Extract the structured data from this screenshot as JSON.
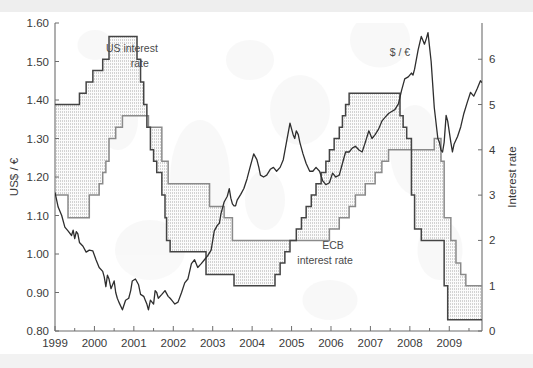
{
  "chart_data": {
    "type": "line",
    "title": "",
    "subtitle": "",
    "xlabel": "",
    "ylabel": "US$ / €",
    "y2label": "Interest rate",
    "xlim": [
      1999.0,
      2009.83
    ],
    "ylim": [
      0.8,
      1.6
    ],
    "y2lim": [
      0,
      6.8
    ],
    "grid": false,
    "legend_position": "inline-annotations",
    "xticks": [
      1999,
      2000,
      2001,
      2002,
      2003,
      2004,
      2005,
      2006,
      2007,
      2008,
      2009
    ],
    "xticklabels": [
      "1999",
      "2000",
      "2001",
      "2002",
      "2003",
      "2004",
      "2005",
      "2006",
      "2007",
      "2008",
      "2009"
    ],
    "xminor_interval": 0.5,
    "yticks": [
      0.8,
      0.9,
      1.0,
      1.1,
      1.2,
      1.3,
      1.4,
      1.5,
      1.6
    ],
    "yticklabels": [
      "0.80",
      "0.90",
      "1.00",
      "1.10",
      "1.20",
      "1.30",
      "1.40",
      "1.50",
      "1.60"
    ],
    "y2ticks": [
      0,
      1,
      2,
      3,
      4,
      5,
      6
    ],
    "y2ticklabels": [
      "0",
      "1",
      "2",
      "3",
      "4",
      "5",
      "6"
    ],
    "annotations": [
      {
        "text": "US interest",
        "x": 2000.95,
        "y": 1.525
      },
      {
        "text": "rate",
        "x": 2001.15,
        "y": 1.487
      },
      {
        "text": "ECB",
        "x": 2006.05,
        "y": 1.012
      },
      {
        "text": "interest rate",
        "x": 2005.85,
        "y": 0.975
      },
      {
        "text": "$ / €",
        "x": 2007.75,
        "y": 1.513
      }
    ],
    "series": [
      {
        "name": "US interest rate",
        "axis": "right",
        "style": "step",
        "color": "#444444",
        "fill": "dotted-light-gray",
        "points": [
          [
            1999.0,
            5.0
          ],
          [
            1999.58,
            5.0
          ],
          [
            1999.62,
            5.25
          ],
          [
            1999.79,
            5.5
          ],
          [
            1999.88,
            5.5
          ],
          [
            1999.96,
            5.75
          ],
          [
            2000.12,
            5.75
          ],
          [
            2000.21,
            6.0
          ],
          [
            2000.29,
            6.0
          ],
          [
            2000.37,
            6.5
          ],
          [
            2000.46,
            6.5
          ],
          [
            2001.04,
            6.5
          ],
          [
            2001.08,
            6.0
          ],
          [
            2001.17,
            5.5
          ],
          [
            2001.25,
            5.0
          ],
          [
            2001.33,
            4.5
          ],
          [
            2001.42,
            4.0
          ],
          [
            2001.5,
            3.75
          ],
          [
            2001.58,
            3.5
          ],
          [
            2001.71,
            3.0
          ],
          [
            2001.79,
            2.5
          ],
          [
            2001.83,
            2.0
          ],
          [
            2001.92,
            1.75
          ],
          [
            2002.75,
            1.75
          ],
          [
            2002.83,
            1.25
          ],
          [
            2003.5,
            1.25
          ],
          [
            2003.54,
            1.0
          ],
          [
            2004.5,
            1.0
          ],
          [
            2004.58,
            1.25
          ],
          [
            2004.71,
            1.5
          ],
          [
            2004.83,
            1.75
          ],
          [
            2004.96,
            2.0
          ],
          [
            2005.12,
            2.25
          ],
          [
            2005.25,
            2.5
          ],
          [
            2005.37,
            2.75
          ],
          [
            2005.5,
            3.0
          ],
          [
            2005.62,
            3.25
          ],
          [
            2005.75,
            3.5
          ],
          [
            2005.87,
            3.75
          ],
          [
            2005.96,
            4.0
          ],
          [
            2006.08,
            4.25
          ],
          [
            2006.21,
            4.5
          ],
          [
            2006.29,
            4.75
          ],
          [
            2006.37,
            5.0
          ],
          [
            2006.46,
            5.25
          ],
          [
            2007.71,
            5.25
          ],
          [
            2007.75,
            4.75
          ],
          [
            2007.83,
            4.5
          ],
          [
            2007.92,
            4.25
          ],
          [
            2008.04,
            3.0
          ],
          [
            2008.12,
            2.25
          ],
          [
            2008.21,
            2.25
          ],
          [
            2008.29,
            2.0
          ],
          [
            2008.79,
            2.0
          ],
          [
            2008.87,
            1.0
          ],
          [
            2008.96,
            0.25
          ],
          [
            2009.83,
            0.25
          ]
        ]
      },
      {
        "name": "ECB interest rate",
        "axis": "right",
        "style": "step",
        "color": "#8a8a8a",
        "fill": "dotted-light-gray",
        "points": [
          [
            1999.0,
            3.0
          ],
          [
            1999.29,
            3.0
          ],
          [
            1999.33,
            2.5
          ],
          [
            1999.83,
            2.5
          ],
          [
            1999.87,
            3.0
          ],
          [
            2000.04,
            3.0
          ],
          [
            2000.12,
            3.25
          ],
          [
            2000.21,
            3.5
          ],
          [
            2000.29,
            3.75
          ],
          [
            2000.37,
            4.25
          ],
          [
            2000.46,
            4.25
          ],
          [
            2000.54,
            4.5
          ],
          [
            2000.71,
            4.75
          ],
          [
            2000.79,
            4.75
          ],
          [
            2001.29,
            4.75
          ],
          [
            2001.37,
            4.5
          ],
          [
            2001.62,
            4.5
          ],
          [
            2001.71,
            3.75
          ],
          [
            2001.79,
            3.75
          ],
          [
            2001.87,
            3.25
          ],
          [
            2002.83,
            3.25
          ],
          [
            2002.92,
            2.75
          ],
          [
            2003.25,
            2.75
          ],
          [
            2003.29,
            2.5
          ],
          [
            2003.46,
            2.5
          ],
          [
            2003.5,
            2.0
          ],
          [
            2005.83,
            2.0
          ],
          [
            2005.96,
            2.25
          ],
          [
            2006.21,
            2.5
          ],
          [
            2006.46,
            2.75
          ],
          [
            2006.62,
            3.0
          ],
          [
            2006.87,
            3.25
          ],
          [
            2007.12,
            3.5
          ],
          [
            2007.29,
            3.75
          ],
          [
            2007.46,
            4.0
          ],
          [
            2008.54,
            4.0
          ],
          [
            2008.62,
            4.25
          ],
          [
            2008.71,
            4.25
          ],
          [
            2008.79,
            3.75
          ],
          [
            2008.87,
            2.5
          ],
          [
            2008.96,
            2.5
          ],
          [
            2009.04,
            2.0
          ],
          [
            2009.17,
            1.5
          ],
          [
            2009.29,
            1.25
          ],
          [
            2009.42,
            1.0
          ],
          [
            2009.83,
            1.0
          ]
        ]
      },
      {
        "name": "$ / €",
        "axis": "left",
        "style": "line",
        "color": "#2e2e2e",
        "points": [
          [
            1999.0,
            1.16
          ],
          [
            1999.08,
            1.122
          ],
          [
            1999.17,
            1.1
          ],
          [
            1999.25,
            1.07
          ],
          [
            1999.33,
            1.06
          ],
          [
            1999.42,
            1.048
          ],
          [
            1999.46,
            1.062
          ],
          [
            1999.5,
            1.04
          ],
          [
            1999.54,
            1.058
          ],
          [
            1999.58,
            1.052
          ],
          [
            1999.62,
            1.03
          ],
          [
            1999.71,
            1.02
          ],
          [
            1999.79,
            1.005
          ],
          [
            1999.87,
            1.01
          ],
          [
            1999.96,
            1.008
          ],
          [
            2000.04,
            0.985
          ],
          [
            2000.12,
            0.965
          ],
          [
            2000.21,
            0.955
          ],
          [
            2000.25,
            0.94
          ],
          [
            2000.29,
            0.915
          ],
          [
            2000.33,
            0.945
          ],
          [
            2000.37,
            0.935
          ],
          [
            2000.42,
            0.91
          ],
          [
            2000.5,
            0.93
          ],
          [
            2000.54,
            0.9
          ],
          [
            2000.58,
            0.885
          ],
          [
            2000.62,
            0.875
          ],
          [
            2000.71,
            0.855
          ],
          [
            2000.79,
            0.88
          ],
          [
            2000.87,
            0.885
          ],
          [
            2000.92,
            0.905
          ],
          [
            2000.96,
            0.93
          ],
          [
            2001.04,
            0.935
          ],
          [
            2001.12,
            0.92
          ],
          [
            2001.17,
            0.895
          ],
          [
            2001.25,
            0.89
          ],
          [
            2001.29,
            0.88
          ],
          [
            2001.33,
            0.87
          ],
          [
            2001.37,
            0.855
          ],
          [
            2001.42,
            0.88
          ],
          [
            2001.5,
            0.87
          ],
          [
            2001.54,
            0.905
          ],
          [
            2001.58,
            0.9
          ],
          [
            2001.62,
            0.885
          ],
          [
            2001.71,
            0.895
          ],
          [
            2001.79,
            0.905
          ],
          [
            2001.87,
            0.89
          ],
          [
            2001.92,
            0.885
          ],
          [
            2001.96,
            0.88
          ],
          [
            2002.04,
            0.87
          ],
          [
            2002.12,
            0.875
          ],
          [
            2002.21,
            0.9
          ],
          [
            2002.29,
            0.925
          ],
          [
            2002.37,
            0.935
          ],
          [
            2002.46,
            0.975
          ],
          [
            2002.54,
            0.985
          ],
          [
            2002.62,
            0.965
          ],
          [
            2002.71,
            0.975
          ],
          [
            2002.79,
            0.985
          ],
          [
            2002.87,
            0.995
          ],
          [
            2002.96,
            1.01
          ],
          [
            2003.04,
            1.06
          ],
          [
            2003.12,
            1.075
          ],
          [
            2003.17,
            1.08
          ],
          [
            2003.21,
            1.105
          ],
          [
            2003.29,
            1.135
          ],
          [
            2003.37,
            1.15
          ],
          [
            2003.42,
            1.17
          ],
          [
            2003.46,
            1.145
          ],
          [
            2003.5,
            1.13
          ],
          [
            2003.54,
            1.125
          ],
          [
            2003.58,
            1.125
          ],
          [
            2003.62,
            1.14
          ],
          [
            2003.71,
            1.155
          ],
          [
            2003.79,
            1.17
          ],
          [
            2003.87,
            1.195
          ],
          [
            2003.96,
            1.23
          ],
          [
            2004.04,
            1.26
          ],
          [
            2004.12,
            1.245
          ],
          [
            2004.17,
            1.225
          ],
          [
            2004.21,
            1.205
          ],
          [
            2004.29,
            1.2
          ],
          [
            2004.37,
            1.205
          ],
          [
            2004.46,
            1.22
          ],
          [
            2004.54,
            1.225
          ],
          [
            2004.62,
            1.215
          ],
          [
            2004.71,
            1.225
          ],
          [
            2004.79,
            1.245
          ],
          [
            2004.87,
            1.29
          ],
          [
            2004.96,
            1.34
          ],
          [
            2005.04,
            1.31
          ],
          [
            2005.08,
            1.3
          ],
          [
            2005.12,
            1.32
          ],
          [
            2005.17,
            1.31
          ],
          [
            2005.21,
            1.29
          ],
          [
            2005.29,
            1.26
          ],
          [
            2005.37,
            1.235
          ],
          [
            2005.46,
            1.215
          ],
          [
            2005.54,
            1.215
          ],
          [
            2005.62,
            1.225
          ],
          [
            2005.71,
            1.215
          ],
          [
            2005.79,
            1.19
          ],
          [
            2005.87,
            1.18
          ],
          [
            2005.96,
            1.185
          ],
          [
            2006.04,
            1.21
          ],
          [
            2006.12,
            1.2
          ],
          [
            2006.21,
            1.205
          ],
          [
            2006.29,
            1.235
          ],
          [
            2006.37,
            1.265
          ],
          [
            2006.46,
            1.265
          ],
          [
            2006.54,
            1.275
          ],
          [
            2006.62,
            1.28
          ],
          [
            2006.71,
            1.27
          ],
          [
            2006.79,
            1.265
          ],
          [
            2006.87,
            1.29
          ],
          [
            2006.96,
            1.32
          ],
          [
            2007.04,
            1.3
          ],
          [
            2007.12,
            1.31
          ],
          [
            2007.21,
            1.325
          ],
          [
            2007.29,
            1.345
          ],
          [
            2007.37,
            1.355
          ],
          [
            2007.46,
            1.365
          ],
          [
            2007.54,
            1.37
          ],
          [
            2007.62,
            1.375
          ],
          [
            2007.71,
            1.39
          ],
          [
            2007.79,
            1.425
          ],
          [
            2007.87,
            1.455
          ],
          [
            2007.96,
            1.46
          ],
          [
            2008.04,
            1.47
          ],
          [
            2008.08,
            1.465
          ],
          [
            2008.12,
            1.48
          ],
          [
            2008.21,
            1.53
          ],
          [
            2008.29,
            1.565
          ],
          [
            2008.33,
            1.555
          ],
          [
            2008.37,
            1.545
          ],
          [
            2008.42,
            1.56
          ],
          [
            2008.46,
            1.575
          ],
          [
            2008.54,
            1.5
          ],
          [
            2008.58,
            1.44
          ],
          [
            2008.62,
            1.38
          ],
          [
            2008.71,
            1.3
          ],
          [
            2008.75,
            1.29
          ],
          [
            2008.79,
            1.27
          ],
          [
            2008.83,
            1.265
          ],
          [
            2008.87,
            1.29
          ],
          [
            2008.92,
            1.36
          ],
          [
            2008.96,
            1.345
          ],
          [
            2009.04,
            1.29
          ],
          [
            2009.08,
            1.265
          ],
          [
            2009.12,
            1.285
          ],
          [
            2009.21,
            1.305
          ],
          [
            2009.29,
            1.33
          ],
          [
            2009.37,
            1.365
          ],
          [
            2009.46,
            1.395
          ],
          [
            2009.54,
            1.42
          ],
          [
            2009.62,
            1.41
          ],
          [
            2009.71,
            1.43
          ],
          [
            2009.79,
            1.45
          ],
          [
            2009.83,
            1.445
          ]
        ]
      }
    ]
  },
  "axes": {
    "left_title": "US$ / €",
    "right_title": "Interest rate"
  },
  "colors": {
    "us_rate_line": "#444444",
    "ecb_rate_line": "#8a8a8a",
    "exchange_line": "#2e2e2e",
    "band_fill": "#ebebeb",
    "axis": "#6d6d6d",
    "text": "#3a3a3a"
  }
}
